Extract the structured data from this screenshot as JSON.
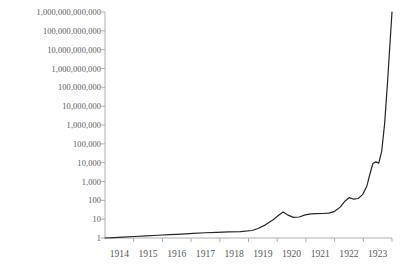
{
  "chart_data": {
    "type": "line",
    "title": "",
    "subtitle": "",
    "xlabel": "",
    "ylabel": "",
    "yscale": "log",
    "xscale": "linear",
    "grid": false,
    "legend": false,
    "legend_position": "none",
    "line_color": "#262626",
    "axis_color": "#a6a6a6",
    "text_color": "#5a5a5a",
    "background_color": "#ffffff",
    "ylim": [
      1,
      1000000000000
    ],
    "xlim": [
      1914,
      1923.75
    ],
    "y_tick_labels": [
      "1,000,000,000,000",
      "100,000,000,000",
      "10,000,000,000",
      "1,000,000,000",
      "100,000,000",
      "10,000,000",
      "1,000,000",
      "100,000",
      "10,000",
      "1,000",
      "100",
      "10",
      "1"
    ],
    "y_tick_values": [
      1000000000000,
      100000000000,
      10000000000,
      1000000000,
      100000000,
      10000000,
      1000000,
      100000,
      10000,
      1000,
      100,
      10,
      1
    ],
    "x_tick_labels": [
      "1914",
      "1915",
      "1916",
      "1917",
      "1918",
      "1919",
      "1920",
      "1921",
      "1922",
      "1923"
    ],
    "x_tick_values": [
      1914,
      1915,
      1916,
      1917,
      1918,
      1919,
      1920,
      1921,
      1922,
      1923
    ],
    "series": [
      {
        "name": "index",
        "x": [
          1914.0,
          1914.3,
          1914.6,
          1915.0,
          1915.4,
          1915.8,
          1916.2,
          1916.6,
          1917.0,
          1917.4,
          1917.8,
          1918.2,
          1918.6,
          1919.0,
          1919.2,
          1919.45,
          1919.7,
          1919.9,
          1920.05,
          1920.2,
          1920.4,
          1920.6,
          1920.8,
          1921.0,
          1921.2,
          1921.4,
          1921.6,
          1921.8,
          1922.0,
          1922.15,
          1922.3,
          1922.45,
          1922.6,
          1922.75,
          1922.9,
          1923.0,
          1923.1,
          1923.2,
          1923.3,
          1923.4,
          1923.5,
          1923.6,
          1923.68,
          1923.75
        ],
        "y": [
          1.0,
          1.05,
          1.1,
          1.2,
          1.3,
          1.4,
          1.5,
          1.6,
          1.75,
          1.9,
          2.0,
          2.1,
          2.2,
          2.5,
          3.2,
          5.0,
          9.0,
          16.0,
          24.0,
          17.0,
          12.5,
          13.0,
          17.0,
          19.0,
          19.5,
          20.0,
          21.0,
          26.0,
          45.0,
          90.0,
          140.0,
          115.0,
          125.0,
          200.0,
          600.0,
          2500.0,
          9000.0,
          11000.0,
          9500.0,
          40000.0,
          1200000.0,
          200000000.0,
          20000000000.0,
          1000000000000.0
        ]
      }
    ],
    "annotations": []
  },
  "geometry": {
    "plot_left": 105,
    "plot_right": 392,
    "plot_top": 12,
    "plot_bottom": 238,
    "x_axis_label_y": 248,
    "tick_length": 4
  }
}
